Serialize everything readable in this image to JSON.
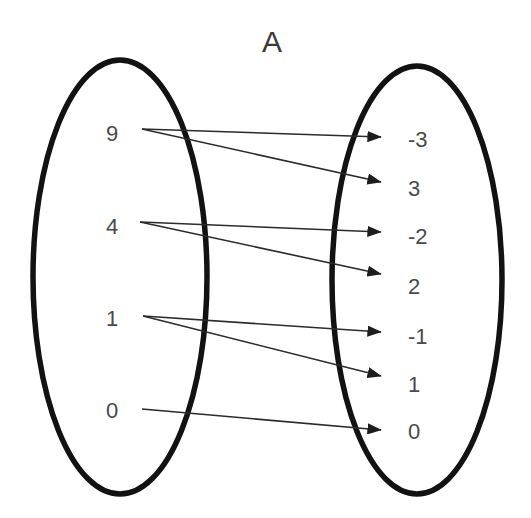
{
  "diagram": {
    "title": "A",
    "title_x": 272,
    "title_y": 52,
    "background_color": "#ffffff",
    "ellipse_color": "#121212",
    "text_color": "#4a4a4a",
    "arrow_color": "#2b2b2b",
    "domain_set": {
      "name": "domain-ellipse",
      "cx": 120,
      "cy": 277,
      "rx": 87,
      "ry": 217,
      "elements": [
        {
          "label": "9",
          "x": 112,
          "y": 135,
          "anchor_x": 142,
          "anchor_y": 129
        },
        {
          "label": "4",
          "x": 112,
          "y": 228,
          "anchor_x": 140,
          "anchor_y": 222
        },
        {
          "label": "1",
          "x": 112,
          "y": 320,
          "anchor_x": 143,
          "anchor_y": 316
        },
        {
          "label": "0",
          "x": 112,
          "y": 412,
          "anchor_x": 142,
          "anchor_y": 409
        }
      ]
    },
    "codomain_set": {
      "name": "codomain-ellipse",
      "cx": 417,
      "cy": 280,
      "rx": 85,
      "ry": 214,
      "elements": [
        {
          "label": "-3",
          "x": 408,
          "y": 141,
          "arrow_tip_x": 381,
          "arrow_tip_y": 137
        },
        {
          "label": "3",
          "x": 408,
          "y": 190,
          "arrow_tip_x": 381,
          "arrow_tip_y": 182
        },
        {
          "label": "-2",
          "x": 408,
          "y": 238,
          "arrow_tip_x": 381,
          "arrow_tip_y": 232
        },
        {
          "label": "2",
          "x": 408,
          "y": 288,
          "arrow_tip_x": 381,
          "arrow_tip_y": 274
        },
        {
          "label": "-1",
          "x": 408,
          "y": 338,
          "arrow_tip_x": 381,
          "arrow_tip_y": 332
        },
        {
          "label": "1",
          "x": 408,
          "y": 386,
          "arrow_tip_x": 381,
          "arrow_tip_y": 376
        },
        {
          "label": "0",
          "x": 408,
          "y": 433,
          "arrow_tip_x": 381,
          "arrow_tip_y": 430
        }
      ]
    },
    "mappings": [
      {
        "from": "9",
        "to": "-3",
        "x1": 142,
        "y1": 129,
        "x2": 381,
        "y2": 137
      },
      {
        "from": "9",
        "to": "3",
        "x1": 142,
        "y1": 129,
        "x2": 381,
        "y2": 182
      },
      {
        "from": "4",
        "to": "-2",
        "x1": 140,
        "y1": 222,
        "x2": 381,
        "y2": 232
      },
      {
        "from": "4",
        "to": "2",
        "x1": 140,
        "y1": 222,
        "x2": 381,
        "y2": 274
      },
      {
        "from": "1",
        "to": "-1",
        "x1": 143,
        "y1": 316,
        "x2": 381,
        "y2": 332
      },
      {
        "from": "1",
        "to": "1",
        "x1": 143,
        "y1": 316,
        "x2": 381,
        "y2": 376
      },
      {
        "from": "0",
        "to": "0",
        "x1": 142,
        "y1": 409,
        "x2": 381,
        "y2": 430
      }
    ]
  }
}
